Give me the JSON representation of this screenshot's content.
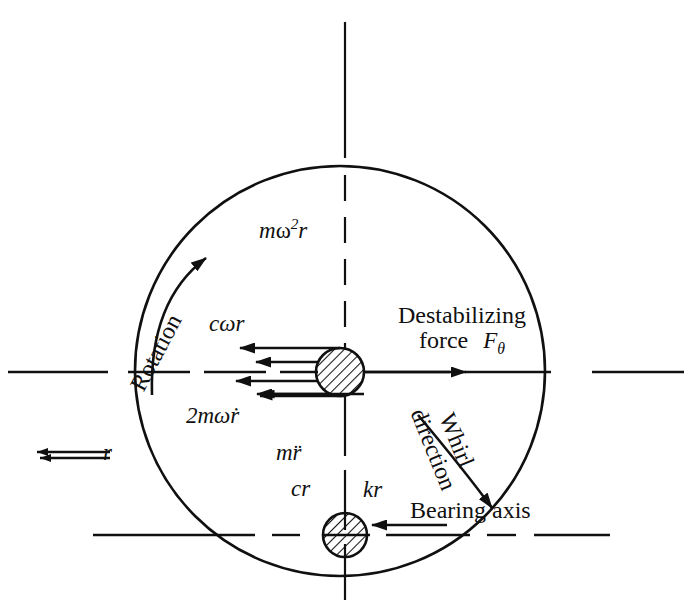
{
  "figure": {
    "stroke_color": "#101010",
    "background_color": "#ffffff"
  },
  "labels": {
    "centrifugal_force": "mw2r",
    "centrifugal_force_parts": {
      "m": "m",
      "omega": "ω",
      "exp": "2",
      "r": "r"
    },
    "damping_tangential": "cωr",
    "coriolis": "2mωṙ",
    "inertia": "mr̈",
    "damping_radial": "cr",
    "stiffness": "kr",
    "destabilizing_line1": "Destabilizing",
    "destabilizing_line2": "force",
    "destabilizing_symbol": "F",
    "destabilizing_subscript": "θ",
    "rotation": "Rotation",
    "whirl_line1": "Whirl",
    "whirl_line2": "direction",
    "bearing_axis": "Bearing axis",
    "radius_dimension": "r"
  },
  "geometry": {
    "orbit_center_x": 340,
    "orbit_center_y": 371,
    "orbit_radius": 205,
    "disc_center_x": 340,
    "disc_center_y": 372,
    "disc_radius": 24,
    "bearing_disc_center_x": 345,
    "bearing_disc_center_y": 535,
    "bearing_disc_radius": 22,
    "upper_axis_y": 372,
    "lower_axis_y": 535,
    "vertical_axis_x": 345
  },
  "forces": [
    {
      "name": "centrifugal",
      "label": "mw2r",
      "direction": "up",
      "from_x": 340,
      "from_y": 348,
      "to_x": 340,
      "to_y": 241
    },
    {
      "name": "damping-tangential",
      "label": "cωr",
      "direction": "left",
      "from_x": 318,
      "from_y": 362,
      "to_x": 252,
      "to_y": 362
    },
    {
      "name": "coriolis",
      "label": "2mωṙ",
      "direction": "left",
      "from_x": 318,
      "from_y": 381,
      "to_x": 232,
      "to_y": 381
    },
    {
      "name": "destabilizing",
      "label": "Fθ",
      "direction": "right",
      "from_x": 364,
      "from_y": 372,
      "to_x": 470,
      "to_y": 372
    },
    {
      "name": "inertia",
      "label": "mr̈",
      "direction": "down",
      "from_x": 327,
      "from_y": 394,
      "to_x": 327,
      "to_y": 463
    },
    {
      "name": "damping-radial",
      "label": "cr",
      "direction": "down",
      "from_x": 345,
      "from_y": 396,
      "to_x": 345,
      "to_y": 485
    },
    {
      "name": "stiffness",
      "label": "kr",
      "direction": "down",
      "from_x": 364,
      "from_y": 394,
      "to_x": 364,
      "to_y": 505
    }
  ]
}
